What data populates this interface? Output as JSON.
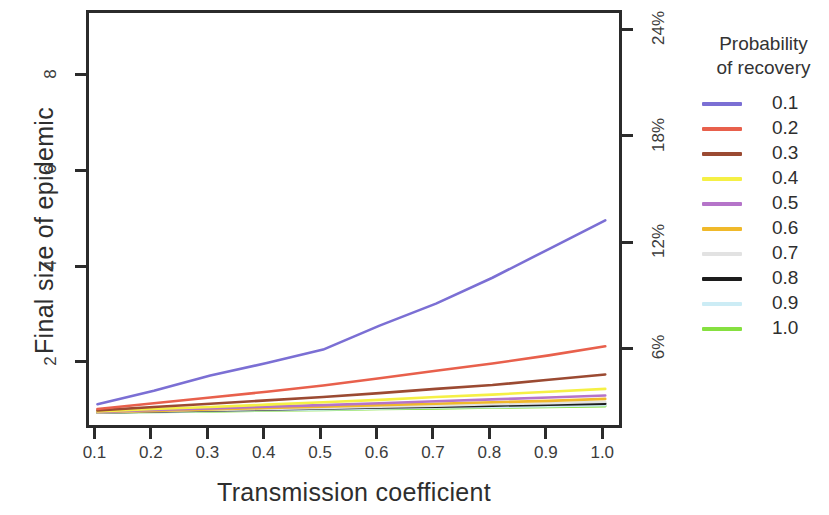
{
  "chart_data": {
    "type": "line",
    "title": "",
    "xlabel": "Transmission coefficient",
    "ylabel": "Final size of epidemic",
    "y2label": "",
    "xlim": [
      0.085,
      1.035
    ],
    "ylim": [
      0.62,
      9.35
    ],
    "y2lim": [
      1.5,
      25.1
    ],
    "grid": false,
    "legend_position": "right",
    "legend_title": "Probability\nof recovery",
    "legend_title_line1": "Probability",
    "legend_title_line2": "of recovery",
    "xticks": [
      "0.1",
      "0.2",
      "0.3",
      "0.4",
      "0.5",
      "0.6",
      "0.7",
      "0.8",
      "0.9",
      "1.0"
    ],
    "xtick_values": [
      0.1,
      0.2,
      0.3,
      0.4,
      0.5,
      0.6,
      0.7,
      0.8,
      0.9,
      1.0
    ],
    "yticks": [
      "2",
      "4",
      "6",
      "8"
    ],
    "ytick_values": [
      2,
      4,
      6,
      8
    ],
    "y2ticks": [
      "6%",
      "12%",
      "18%",
      "24%"
    ],
    "y2tick_values": [
      6,
      12,
      18,
      24
    ],
    "x": [
      0.1,
      0.2,
      0.3,
      0.4,
      0.5,
      0.6,
      0.7,
      0.8,
      0.9,
      1.0
    ],
    "series": [
      {
        "name": "0.1",
        "color": "#7b6fd4",
        "width": 2.6,
        "values": [
          1.18,
          1.46,
          1.78,
          2.04,
          2.32,
          2.82,
          3.28,
          3.82,
          4.42,
          5.02
        ]
      },
      {
        "name": "0.2",
        "color": "#e8604c",
        "width": 2.6,
        "values": [
          1.08,
          1.2,
          1.32,
          1.44,
          1.57,
          1.72,
          1.88,
          2.03,
          2.2,
          2.39
        ]
      },
      {
        "name": "0.3",
        "color": "#9b4a32",
        "width": 2.6,
        "values": [
          1.05,
          1.12,
          1.19,
          1.26,
          1.33,
          1.41,
          1.5,
          1.58,
          1.69,
          1.8
        ]
      },
      {
        "name": "0.4",
        "color": "#f5f045",
        "width": 2.6,
        "values": [
          1.03,
          1.08,
          1.12,
          1.17,
          1.22,
          1.27,
          1.33,
          1.38,
          1.44,
          1.5
        ]
      },
      {
        "name": "0.5",
        "color": "#b574c9",
        "width": 2.6,
        "values": [
          1.02,
          1.06,
          1.09,
          1.13,
          1.16,
          1.2,
          1.24,
          1.28,
          1.32,
          1.36
        ]
      },
      {
        "name": "0.6",
        "color": "#f0b92a",
        "width": 2.6,
        "values": [
          1.02,
          1.04,
          1.07,
          1.1,
          1.13,
          1.16,
          1.19,
          1.22,
          1.25,
          1.29
        ]
      },
      {
        "name": "0.7",
        "color": "#e2e2e2",
        "width": 2.6,
        "values": [
          1.01,
          1.04,
          1.06,
          1.08,
          1.1,
          1.13,
          1.15,
          1.18,
          1.2,
          1.23
        ]
      },
      {
        "name": "0.8",
        "color": "#1c1c1c",
        "width": 2.6,
        "values": [
          1.01,
          1.03,
          1.05,
          1.07,
          1.09,
          1.11,
          1.13,
          1.15,
          1.17,
          1.19
        ]
      },
      {
        "name": "0.9",
        "color": "#ccecf5",
        "width": 2.6,
        "values": [
          1.01,
          1.02,
          1.04,
          1.06,
          1.07,
          1.09,
          1.11,
          1.12,
          1.14,
          1.16
        ]
      },
      {
        "name": "1.0",
        "color": "#86e040",
        "width": 2.6,
        "values": [
          1.0,
          1.02,
          1.03,
          1.05,
          1.06,
          1.08,
          1.09,
          1.11,
          1.12,
          1.14
        ]
      }
    ]
  }
}
